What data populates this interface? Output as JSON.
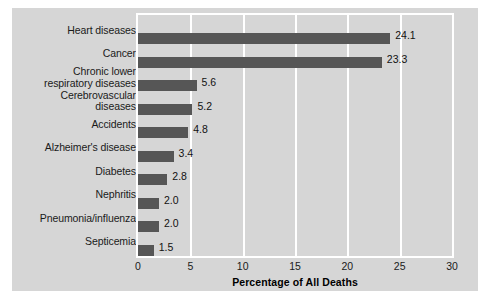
{
  "chart_data": {
    "type": "bar",
    "orientation": "horizontal",
    "title": "",
    "xlabel": "Percentage of All Deaths",
    "ylabel": "",
    "xlim": [
      0,
      30
    ],
    "xticks": [
      0,
      5,
      10,
      15,
      20,
      25,
      30
    ],
    "grid": "vertical",
    "legend": "none",
    "categories": [
      "Heart diseases",
      "Cancer",
      "Chronic lower respiratory diseases",
      "Cerebrovascular diseases",
      "Accidents",
      "Alzheimer's disease",
      "Diabetes",
      "Nephritis",
      "Pneumonia/influenza",
      "Septicemia"
    ],
    "values": [
      24.1,
      23.3,
      5.6,
      5.2,
      4.8,
      3.4,
      2.8,
      2.0,
      2.0,
      1.5
    ],
    "value_labels": [
      "24.1",
      "23.3",
      "5.6",
      "5.2",
      "4.8",
      "3.4",
      "2.8",
      "2.0",
      "2.0",
      "1.5"
    ],
    "category_lines": [
      [
        "Heart diseases"
      ],
      [
        "Cancer"
      ],
      [
        "Chronic lower",
        "respiratory diseases"
      ],
      [
        "Cerebrovascular",
        "diseases"
      ],
      [
        "Accidents"
      ],
      [
        "Alzheimer's disease"
      ],
      [
        "Diabetes"
      ],
      [
        "Nephritis"
      ],
      [
        "Pneumonia/influenza"
      ],
      [
        "Septicemia"
      ]
    ],
    "colors": {
      "bar": "#565656",
      "panel_background": "#d6d6d6",
      "gridline": "#ffffff",
      "text": "#1a1a1a"
    }
  }
}
